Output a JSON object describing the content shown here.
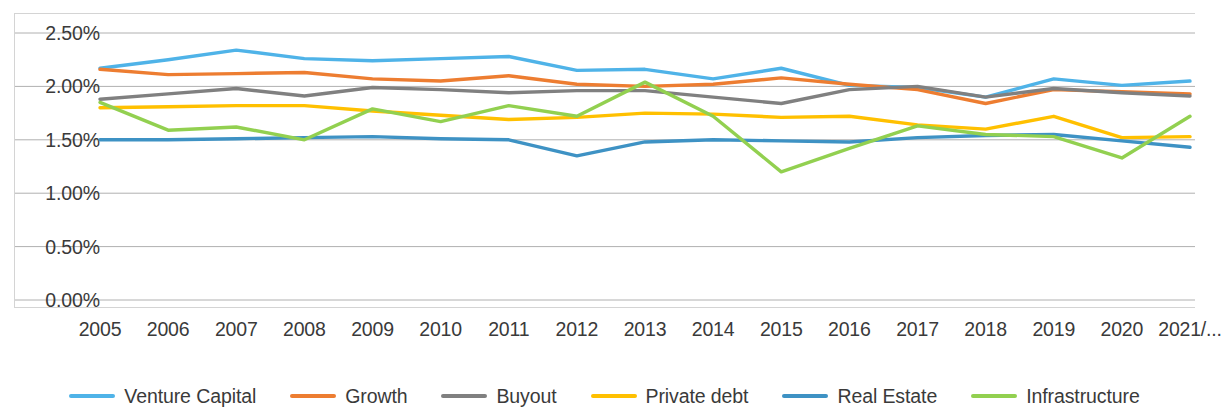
{
  "chart_data": {
    "type": "line",
    "title": "",
    "xlabel": "",
    "ylabel": "",
    "ylim": [
      0.0,
      2.5
    ],
    "grid": true,
    "legend_position": "bottom",
    "y_ticks": [
      0.0,
      0.5,
      1.0,
      1.5,
      2.0,
      2.5
    ],
    "y_tick_labels": [
      "0.00%",
      "0.50%",
      "1.00%",
      "1.50%",
      "2.00%",
      "2.50%"
    ],
    "categories": [
      "2005",
      "2006",
      "2007",
      "2008",
      "2009",
      "2010",
      "2011",
      "2012",
      "2013",
      "2014",
      "2015",
      "2016",
      "2017",
      "2018",
      "2019",
      "2020",
      "2021/..."
    ],
    "series": [
      {
        "name": "Venture Capital",
        "color": "#4FB3E8",
        "values": [
          2.17,
          2.25,
          2.34,
          2.26,
          2.24,
          2.26,
          2.28,
          2.15,
          2.16,
          2.07,
          2.17,
          2.01,
          1.99,
          1.9,
          2.07,
          2.01,
          2.05
        ]
      },
      {
        "name": "Growth",
        "color": "#ED7D31",
        "values": [
          2.16,
          2.11,
          2.12,
          2.13,
          2.07,
          2.05,
          2.1,
          2.02,
          2.0,
          2.02,
          2.08,
          2.02,
          1.97,
          1.84,
          1.97,
          1.95,
          1.93
        ]
      },
      {
        "name": "Buyout",
        "color": "#808080",
        "values": [
          1.88,
          1.93,
          1.98,
          1.91,
          1.99,
          1.97,
          1.94,
          1.96,
          1.96,
          1.9,
          1.84,
          1.97,
          2.0,
          1.9,
          1.98,
          1.94,
          1.91
        ]
      },
      {
        "name": "Private debt",
        "color": "#FFC000",
        "values": [
          1.8,
          1.81,
          1.82,
          1.82,
          1.77,
          1.73,
          1.69,
          1.71,
          1.75,
          1.74,
          1.71,
          1.72,
          1.64,
          1.6,
          1.72,
          1.52,
          1.53
        ]
      },
      {
        "name": "Real Estate",
        "color": "#3E92C4",
        "values": [
          1.5,
          1.5,
          1.51,
          1.52,
          1.53,
          1.51,
          1.5,
          1.35,
          1.48,
          1.5,
          1.49,
          1.48,
          1.52,
          1.54,
          1.55,
          1.49,
          1.43
        ]
      },
      {
        "name": "Infrastructure",
        "color": "#92D050",
        "values": [
          1.85,
          1.59,
          1.62,
          1.5,
          1.79,
          1.67,
          1.82,
          1.72,
          2.04,
          1.72,
          1.2,
          1.42,
          1.63,
          1.55,
          1.53,
          1.33,
          1.72
        ]
      }
    ]
  }
}
